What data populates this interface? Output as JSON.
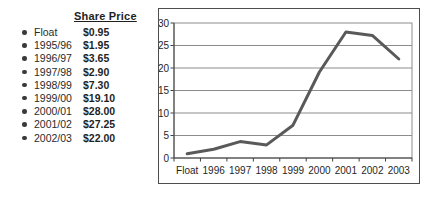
{
  "share_price_list": {
    "header": "Share Price",
    "rows": [
      {
        "label": "Float",
        "value": "$0.95"
      },
      {
        "label": "1995/96",
        "value": "$1.95"
      },
      {
        "label": "1996/97",
        "value": "$3.65"
      },
      {
        "label": "1997/98",
        "value": "$2.90"
      },
      {
        "label": "1998/99",
        "value": "$7.30"
      },
      {
        "label": "1999/00",
        "value": "$19.10"
      },
      {
        "label": "2000/01",
        "value": "$28.00"
      },
      {
        "label": "2001/02",
        "value": "$27.25"
      },
      {
        "label": "2002/03",
        "value": "$22.00"
      }
    ]
  },
  "chart_data": {
    "type": "line",
    "title": "",
    "categories": [
      "Float",
      "1996",
      "1997",
      "1998",
      "1999",
      "2000",
      "2001",
      "2002",
      "2003"
    ],
    "series": [
      {
        "name": "Share Price",
        "values": [
          0.95,
          1.95,
          3.65,
          2.9,
          7.3,
          19.1,
          28.0,
          27.25,
          22.0
        ]
      }
    ],
    "xlabel": "",
    "ylabel": "",
    "ylim": [
      0,
      30
    ],
    "ytick_step": 5,
    "grid": "horizontal",
    "legend": "none",
    "line_color": "#595959"
  }
}
